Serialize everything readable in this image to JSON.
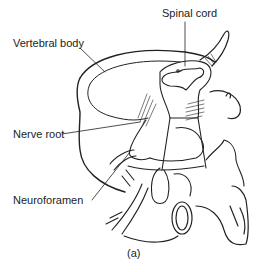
{
  "figure": {
    "caption": "(a)",
    "labels": {
      "spinal_cord": "Spinal cord",
      "vertebral_body": "Vertebral body",
      "nerve_root": "Nerve root",
      "neuroforamen": "Neuroforamen"
    }
  }
}
